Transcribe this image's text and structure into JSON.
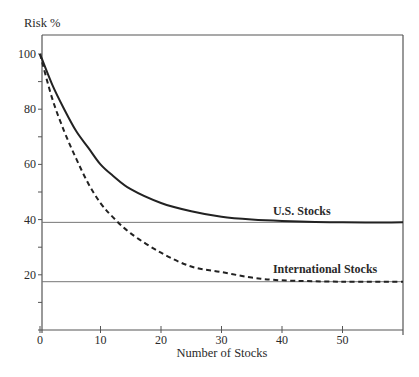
{
  "chart_data": {
    "type": "line",
    "title": "",
    "xlabel": "Number of Stocks",
    "ylabel": "Risk %",
    "xlim": [
      0,
      60
    ],
    "ylim": [
      0,
      100
    ],
    "x_ticks": [
      0,
      10,
      20,
      30,
      40,
      50
    ],
    "x_tick_labels": [
      "0",
      "10",
      "20",
      "30",
      "40",
      "50"
    ],
    "y_ticks": [
      20,
      40,
      60,
      80,
      100
    ],
    "y_tick_labels": [
      "20",
      "40",
      "60",
      "80",
      "100"
    ],
    "y_minor_ticks": [
      10,
      30,
      50,
      70,
      90
    ],
    "grid": false,
    "legend": "inline annotations",
    "series": [
      {
        "name": "U.S. Stocks",
        "style": "solid",
        "x": [
          0,
          2,
          4,
          6,
          8,
          10,
          12,
          15,
          20,
          25,
          30,
          35,
          40,
          50,
          60
        ],
        "values": [
          100,
          89,
          80,
          72,
          66,
          60,
          56,
          51,
          46,
          43,
          41,
          40,
          39.5,
          39,
          39
        ],
        "asymptote": 39
      },
      {
        "name": "International Stocks",
        "style": "dashed",
        "x": [
          0,
          2,
          4,
          6,
          8,
          10,
          12,
          15,
          20,
          25,
          30,
          35,
          40,
          50,
          60
        ],
        "values": [
          100,
          84,
          72,
          62,
          53,
          46,
          41,
          35,
          28,
          23,
          21,
          19,
          18,
          17.5,
          17.5
        ],
        "asymptote": 17.5
      }
    ],
    "reference_lines": [
      {
        "y": 39,
        "label": "U.S. Stocks"
      },
      {
        "y": 17.5,
        "label": "International Stocks"
      }
    ],
    "annotations": [
      {
        "text": "U.S. Stocks",
        "x": 38,
        "y": 42
      },
      {
        "text": "International Stocks",
        "x": 38,
        "y": 21
      }
    ]
  }
}
